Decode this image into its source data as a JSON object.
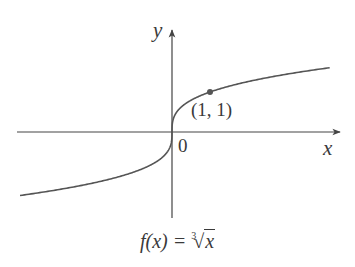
{
  "chart_data": {
    "type": "line",
    "function": "cube root",
    "xlabel": "x",
    "ylabel": "y",
    "origin_label": "0",
    "grid": false,
    "legend": null,
    "xlim": [
      -4,
      4.2
    ],
    "ylim": [
      -2.2,
      2.5
    ],
    "series": [
      {
        "name": "f(x) = ∛x",
        "x": [
          -4,
          -3,
          -2,
          -1,
          -0.5,
          -0.125,
          0,
          0.125,
          0.5,
          1,
          2,
          3,
          4,
          4.15
        ],
        "y": [
          -1.587,
          -1.442,
          -1.26,
          -1,
          -0.794,
          -0.5,
          0,
          0.5,
          0.794,
          1,
          1.26,
          1.442,
          1.587,
          1.607
        ]
      }
    ],
    "annotations": [
      {
        "type": "point",
        "x": 1,
        "y": 1,
        "label": "(1, 1)"
      }
    ]
  },
  "labels": {
    "y_axis": "y",
    "x_axis": "x",
    "origin": "0",
    "point": "(1, 1)",
    "caption_prefix": "f(x) = ",
    "caption_index": "3",
    "caption_radical": "√",
    "caption_radicand": "x"
  },
  "colors": {
    "axis": "#444444",
    "curve": "#555555",
    "point": "#555555",
    "text": "#3a3a3a"
  }
}
